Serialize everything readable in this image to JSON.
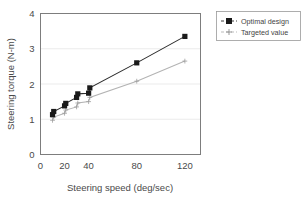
{
  "chart_data": {
    "type": "line",
    "title": "",
    "xlabel": "Steering speed (deg/sec)",
    "ylabel": "Steering torque (N-m)",
    "xlim": [
      0,
      133
    ],
    "ylim": [
      0,
      4
    ],
    "xticks": [
      0,
      20,
      40,
      80,
      120
    ],
    "xticklabels": [
      "0",
      "20",
      "40",
      "80",
      "120"
    ],
    "yticks": [
      0,
      1,
      2,
      3,
      4
    ],
    "yticklabels": [
      "0",
      "1",
      "2",
      "3",
      "4"
    ],
    "grid": "horizontal",
    "legend_position": "outside-top-right",
    "series": [
      {
        "name": "Optimal design",
        "marker": "filled-square",
        "color": "#1a1a1a",
        "x": [
          10,
          11,
          20,
          21,
          30,
          31,
          40,
          41,
          80,
          120
        ],
        "y": [
          1.13,
          1.22,
          1.38,
          1.45,
          1.62,
          1.72,
          1.74,
          1.89,
          2.6,
          3.35
        ]
      },
      {
        "name": "Targeted value",
        "marker": "plus",
        "color": "#9d9d9d",
        "x": [
          10,
          11,
          20,
          21,
          30,
          31,
          40,
          41,
          80,
          120
        ],
        "y": [
          0.97,
          1.06,
          1.17,
          1.26,
          1.35,
          1.46,
          1.5,
          1.62,
          2.08,
          2.65
        ]
      }
    ]
  },
  "legend": {
    "entries": [
      {
        "label": "Optimal design"
      },
      {
        "label": "Targeted value"
      }
    ]
  },
  "axes": {
    "x_title": "Steering speed (deg/sec)",
    "y_title": "Steering torque (N-m)"
  }
}
